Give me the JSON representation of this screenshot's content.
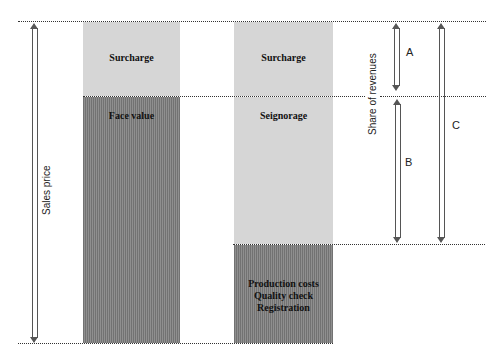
{
  "diagram": {
    "left_column": {
      "segments": [
        {
          "label": "Surcharge",
          "shade": "light"
        },
        {
          "label": "Face value",
          "shade": "dark"
        }
      ]
    },
    "right_column": {
      "segments": [
        {
          "label": "Surcharge",
          "shade": "light"
        },
        {
          "label": "Seignorage",
          "shade": "light"
        },
        {
          "label": "Production costs",
          "label2": "Quality check",
          "label3": "Registration",
          "shade": "dark"
        }
      ]
    },
    "axis_labels": {
      "sales_price": "Sales price",
      "share_of_revenues": "Share of revenues"
    },
    "brackets": {
      "a": "A",
      "b": "B",
      "c": "C"
    },
    "colors": {
      "light_fill": "#d6d6d6",
      "dark_fill": "#8f8f8f",
      "line": "#333333"
    }
  }
}
